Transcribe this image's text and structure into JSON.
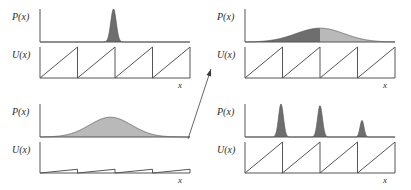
{
  "figure": {
    "title": "",
    "background": "#ffffff",
    "ink_color": "#555555",
    "label_color": "#2b2b2b",
    "fill_dark": "#6e6e6e",
    "fill_light": "#b9b9b9",
    "labels": {
      "p_of_x": "P(x)",
      "u_of_x": "U(x)",
      "x_axis": "x"
    },
    "arrow": {
      "name": "diagonal-arrow",
      "from": [
        188,
        139
      ],
      "to": [
        211,
        69
      ]
    }
  },
  "chart_data": [
    {
      "id": "top-left",
      "type": "line",
      "title": "",
      "panels": [
        {
          "name": "probability-density",
          "ylabel": "P(x)",
          "xlabel": "",
          "type": "area",
          "description": "single narrow tall peak",
          "peaks": [
            {
              "center": 0.49,
              "width": 0.018,
              "height": 1.0,
              "shade": "dark"
            }
          ],
          "xlim": [
            0,
            1
          ],
          "ylim": [
            0,
            1
          ],
          "grid": false
        },
        {
          "name": "potential",
          "ylabel": "U(x)",
          "xlabel": "x",
          "type": "line",
          "description": "sawtooth washboard, zero tilt, four full teeth",
          "teeth": 4,
          "tooth_height": 1.0,
          "tilt": 0.0,
          "xlim": [
            0,
            1
          ],
          "ylim": [
            0,
            1
          ],
          "grid": false
        }
      ]
    },
    {
      "id": "top-right",
      "type": "line",
      "title": "",
      "panels": [
        {
          "name": "probability-density",
          "ylabel": "P(x)",
          "xlabel": "",
          "type": "area",
          "description": "broad low gaussian bump, left half dark, right half light",
          "peaks": [
            {
              "center": 0.5,
              "width": 0.16,
              "height": 0.42,
              "shade": "split"
            }
          ],
          "xlim": [
            0,
            1
          ],
          "ylim": [
            0,
            1
          ],
          "grid": false
        },
        {
          "name": "potential",
          "ylabel": "U(x)",
          "xlabel": "x",
          "type": "line",
          "description": "sawtooth washboard, zero tilt, four full teeth",
          "teeth": 4,
          "tooth_height": 1.0,
          "tilt": 0.0,
          "xlim": [
            0,
            1
          ],
          "ylim": [
            0,
            1
          ],
          "grid": false
        }
      ]
    },
    {
      "id": "bottom-left",
      "type": "line",
      "title": "",
      "panels": [
        {
          "name": "probability-density",
          "ylabel": "P(x)",
          "xlabel": "",
          "type": "area",
          "description": "broad smooth gaussian bump, uniform grey fill",
          "peaks": [
            {
              "center": 0.47,
              "width": 0.14,
              "height": 0.6,
              "shade": "light"
            }
          ],
          "xlim": [
            0,
            1
          ],
          "ylim": [
            0,
            1
          ],
          "grid": false
        },
        {
          "name": "potential",
          "ylabel": "U(x)",
          "xlabel": "x",
          "type": "line",
          "description": "strongly tilted washboard, very shallow teeth",
          "teeth": 4,
          "tooth_height": 0.12,
          "tilt": 0.0,
          "xlim": [
            0,
            1
          ],
          "ylim": [
            0,
            1
          ],
          "grid": false
        }
      ]
    },
    {
      "id": "bottom-right",
      "type": "line",
      "title": "",
      "panels": [
        {
          "name": "probability-density",
          "ylabel": "P(x)",
          "xlabel": "",
          "type": "area",
          "description": "three narrow peaks of decreasing height",
          "peaks": [
            {
              "center": 0.24,
              "width": 0.016,
              "height": 1.0,
              "shade": "dark"
            },
            {
              "center": 0.5,
              "width": 0.016,
              "height": 0.95,
              "shade": "dark"
            },
            {
              "center": 0.78,
              "width": 0.013,
              "height": 0.5,
              "shade": "dark"
            }
          ],
          "xlim": [
            0,
            1
          ],
          "ylim": [
            0,
            1
          ],
          "grid": false
        },
        {
          "name": "potential",
          "ylabel": "U(x)",
          "xlabel": "x",
          "type": "line",
          "description": "sawtooth washboard, zero tilt, four full teeth",
          "teeth": 4,
          "tooth_height": 1.0,
          "tilt": 0.0,
          "xlim": [
            0,
            1
          ],
          "ylim": [
            0,
            1
          ],
          "grid": false
        }
      ]
    }
  ]
}
